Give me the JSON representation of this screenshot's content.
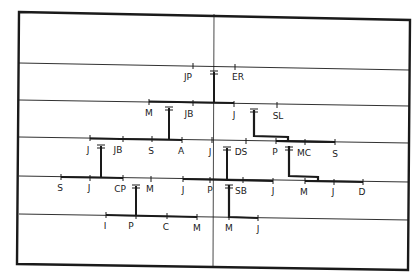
{
  "diagram": {
    "type": "family-tree",
    "colors": {
      "ink": "#1a1a1a",
      "background": "#ffffff"
    },
    "generations": [
      {
        "row": 1,
        "people": [
          {
            "label": "JP",
            "x": 193,
            "y": 66
          },
          {
            "label": "ER",
            "x": 235,
            "y": 67
          }
        ],
        "couples": [
          {
            "a": "JP",
            "b": "ER",
            "marker": "=",
            "x": 214
          }
        ]
      },
      {
        "row": 2,
        "people": [
          {
            "label": "M",
            "x": 149,
            "y": 102
          },
          {
            "label": "JB",
            "x": 193,
            "y": 103
          },
          {
            "label": "J",
            "x": 234,
            "y": 104
          },
          {
            "label": "SL",
            "x": 277,
            "y": 105
          }
        ],
        "couples": [
          {
            "a": "M",
            "b": "JB",
            "marker": "=",
            "x": 169
          },
          {
            "a": "J",
            "b": "SL",
            "marker": "=",
            "x": 254
          }
        ]
      },
      {
        "row": 3,
        "people": [
          {
            "label": "J",
            "x": 90,
            "y": 138
          },
          {
            "label": "JB",
            "x": 123,
            "y": 139
          },
          {
            "label": "S",
            "x": 152,
            "y": 139
          },
          {
            "label": "A",
            "x": 182,
            "y": 140
          },
          {
            "label": "J",
            "x": 212,
            "y": 140
          },
          {
            "label": "DS",
            "x": 246,
            "y": 141
          },
          {
            "label": "P",
            "x": 276,
            "y": 141
          },
          {
            "label": "MC",
            "x": 305,
            "y": 142
          },
          {
            "label": "S",
            "x": 335,
            "y": 142
          }
        ],
        "couples": [
          {
            "a": "J",
            "b": "JB",
            "marker": "=",
            "x": 101
          },
          {
            "a": "J",
            "b": "DS",
            "marker": "=",
            "x": 227
          },
          {
            "a": "P",
            "b": "MC",
            "marker": "=",
            "x": 289
          }
        ]
      },
      {
        "row": 4,
        "people": [
          {
            "label": "S",
            "x": 61,
            "y": 178
          },
          {
            "label": "J",
            "x": 90,
            "y": 178
          },
          {
            "label": "CP",
            "x": 123,
            "y": 179
          },
          {
            "label": "M",
            "x": 151,
            "y": 179
          },
          {
            "label": "J",
            "x": 183,
            "y": 180
          },
          {
            "label": "P",
            "x": 210,
            "y": 180
          },
          {
            "label": "SB",
            "x": 243,
            "y": 181
          },
          {
            "label": "J",
            "x": 273,
            "y": 181
          },
          {
            "label": "M",
            "x": 305,
            "y": 182
          },
          {
            "label": "J",
            "x": 334,
            "y": 182
          },
          {
            "label": "D",
            "x": 363,
            "y": 182
          }
        ],
        "couples": [
          {
            "a": "CP",
            "b": "M",
            "marker": "=",
            "x": 136
          },
          {
            "a": "P",
            "b": "SB",
            "marker": "=",
            "x": 229
          }
        ]
      },
      {
        "row": 5,
        "people": [
          {
            "label": "I",
            "x": 106,
            "y": 216
          },
          {
            "label": "P",
            "x": 136,
            "y": 217
          },
          {
            "label": "C",
            "x": 167,
            "y": 217
          },
          {
            "label": "M",
            "x": 197,
            "y": 218
          },
          {
            "label": "M",
            "x": 229,
            "y": 218
          },
          {
            "label": "J",
            "x": 258,
            "y": 219
          }
        ],
        "couples": []
      }
    ]
  }
}
